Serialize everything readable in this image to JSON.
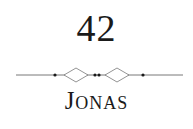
{
  "chapter": {
    "number": "42",
    "title_initial": "J",
    "title_rest": "ONAS",
    "ornament": "divider-ornament"
  },
  "colors": {
    "text": "#1a1a1a",
    "ornament_line": "#555555",
    "ornament_dot": "#1a1a1a",
    "background": "#ffffff"
  }
}
